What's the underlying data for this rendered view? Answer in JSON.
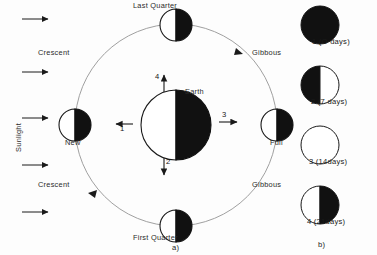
{
  "figure": {
    "title_caption_a": "a)",
    "title_caption_b": "b)",
    "sunlight_label": "Sunlight"
  },
  "panel_a": {
    "center_body": "Earth",
    "orbit_phase_labels": [
      {
        "name": "last-quarter",
        "text": "Last Quarter"
      },
      {
        "name": "new",
        "text": "New"
      },
      {
        "name": "full",
        "text": "Full"
      },
      {
        "name": "first-quarter",
        "text": "First  Quarter"
      }
    ],
    "region_labels": [
      {
        "name": "crescent-upper-left",
        "text": "Crescent"
      },
      {
        "name": "crescent-lower-left",
        "text": "Crescent"
      },
      {
        "name": "gibbous-upper-right",
        "text": "Gibbous"
      },
      {
        "name": "gibbous-lower-right",
        "text": "Gibbous"
      }
    ],
    "direction_arrows": [
      {
        "name": "arrow-1",
        "label": "1",
        "direction": "left"
      },
      {
        "name": "arrow-2",
        "label": "2",
        "direction": "down"
      },
      {
        "name": "arrow-3",
        "label": "3",
        "direction": "right"
      },
      {
        "name": "arrow-4",
        "label": "4",
        "direction": "up"
      }
    ],
    "sunlight_rays_count": 5
  },
  "panel_b": {
    "phases": [
      {
        "name": "phase-1-new",
        "label": "1  (O days)",
        "fill": "full-dark"
      },
      {
        "name": "phase-2-left-dark",
        "label": "2 (7 days)",
        "fill": "left-dark"
      },
      {
        "name": "phase-3-full",
        "label": "3 (14days)",
        "fill": "full-light"
      },
      {
        "name": "phase-4-right-dark",
        "label": "4 (21days)",
        "fill": "right-dark"
      }
    ]
  },
  "colors": {
    "ink": "#1a1a1a",
    "dark_fill": "#111111",
    "light_fill": "#ffffff",
    "orbit_line": "#9a9a9a",
    "background": "#fdfdfd"
  }
}
